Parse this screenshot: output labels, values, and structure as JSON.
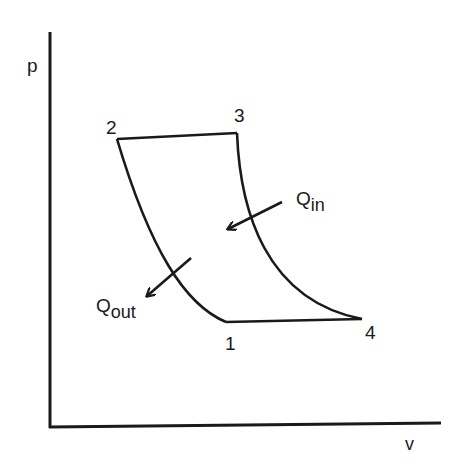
{
  "diagram": {
    "axes": {
      "y_label": "p",
      "x_label": "v"
    },
    "points": [
      {
        "id": "1",
        "label": "1"
      },
      {
        "id": "2",
        "label": "2"
      },
      {
        "id": "3",
        "label": "3"
      },
      {
        "id": "4",
        "label": "4"
      }
    ],
    "heat": {
      "in": {
        "main": "Q",
        "sub": "in"
      },
      "out": {
        "main": "Q",
        "sub": "out"
      }
    },
    "colors": {
      "stroke": "#1a1a1a",
      "background": "#ffffff"
    }
  }
}
